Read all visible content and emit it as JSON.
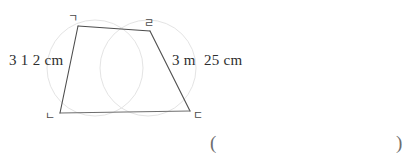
{
  "figure": {
    "type": "trapezoid-diagram",
    "shape_name": "trapezoid",
    "stroke_color": "#4d4d4d",
    "arc_color": "#e2e2e2",
    "vertices": [
      {
        "id": "a",
        "label": "ㄱ",
        "x": 78,
        "y": 26
      },
      {
        "id": "b",
        "label": "ㄹ",
        "x": 150,
        "y": 31
      },
      {
        "id": "c",
        "label": "ㄴ",
        "x": 60,
        "y": 113
      },
      {
        "id": "d",
        "label": "ㄷ",
        "x": 190,
        "y": 111
      }
    ],
    "side_labels": {
      "left": "3 1 2 cm",
      "right": "3 m  25 cm"
    },
    "construction_arcs": [
      {
        "id": "left-arc",
        "cx": 95,
        "cy": 68,
        "r": 48
      },
      {
        "id": "right-arc",
        "cx": 148,
        "cy": 68,
        "r": 48
      }
    ]
  },
  "answer": {
    "open_paren": "(",
    "close_paren": ")"
  }
}
